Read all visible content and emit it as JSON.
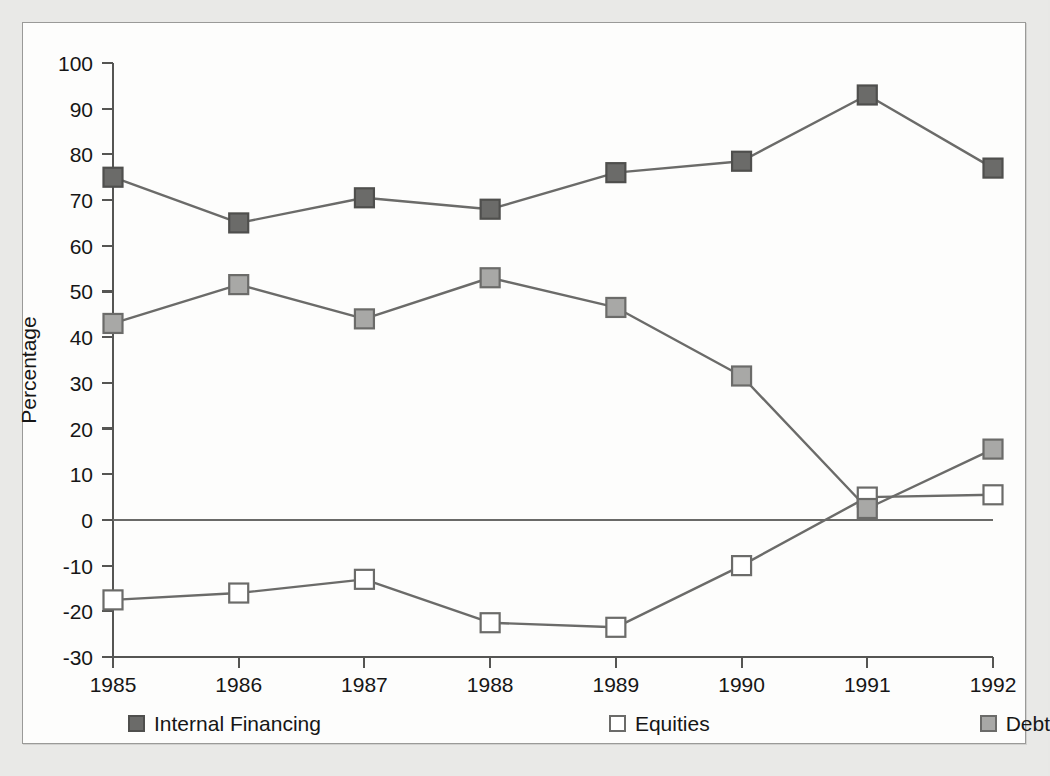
{
  "chart_data": {
    "type": "line",
    "title": "",
    "xlabel": "",
    "ylabel": "Percentage",
    "categories": [
      "1985",
      "1986",
      "1987",
      "1988",
      "1989",
      "1990",
      "1991",
      "1992"
    ],
    "x": [
      1985,
      1986,
      1987,
      1988,
      1989,
      1990,
      1991,
      1992
    ],
    "ylim": [
      -30,
      100
    ],
    "xlim": [
      1985,
      1992
    ],
    "ytick_labels": [
      "100",
      "90",
      "80",
      "70",
      "60",
      "50",
      "40",
      "30",
      "20",
      "10",
      "0",
      "-10",
      "-20",
      "-30"
    ],
    "yticks": [
      100,
      90,
      80,
      70,
      60,
      50,
      40,
      30,
      20,
      10,
      0,
      -10,
      -20,
      -30
    ],
    "xtick_labels": [
      "1985",
      "1986",
      "1987",
      "1988",
      "1989",
      "1990",
      "1991",
      "1992"
    ],
    "grid": false,
    "legend_position": "bottom",
    "zero_line": true,
    "marker": "square",
    "series": [
      {
        "name": "Internal Financing",
        "color": "#6b6b69",
        "marker_fill": "#6b6b69",
        "marker_edge": "#4f4f4d",
        "marker_size": 19,
        "values": [
          75,
          65,
          70.5,
          68,
          76,
          78.5,
          93,
          77
        ]
      },
      {
        "name": "Equities",
        "color": "#6b6b69",
        "marker_fill": "#ffffff",
        "marker_edge": "#6b6b69",
        "marker_size": 19,
        "values": [
          -17.5,
          -16,
          -13,
          -22.5,
          -23.5,
          -10,
          5,
          5.5
        ]
      },
      {
        "name": "Debt",
        "color": "#6b6b69",
        "marker_fill": "#a8a8a6",
        "marker_edge": "#6b6b69",
        "marker_size": 19,
        "values": [
          43,
          51.5,
          44,
          53,
          46.5,
          31.5,
          2.5,
          15.5
        ]
      }
    ]
  },
  "legend": {
    "entries": [
      {
        "label": "Internal Financing",
        "swatch_name": "legend-swatch-internal-financing"
      },
      {
        "label": "Equities",
        "swatch_name": "legend-swatch-equities"
      },
      {
        "label": "Debt",
        "swatch_name": "legend-swatch-debt"
      }
    ]
  },
  "axes": {
    "y_axis_title": "Percentage"
  },
  "colors": {
    "page_background": "#e9e9e7",
    "panel_background": "#fdfdfc",
    "panel_border": "#9a9a98",
    "axis": "#555553",
    "text": "#161616",
    "series_line": "#6b6b69",
    "internal_financing_fill": "#6b6b69",
    "equities_fill": "#ffffff",
    "debt_fill": "#a8a8a6"
  }
}
